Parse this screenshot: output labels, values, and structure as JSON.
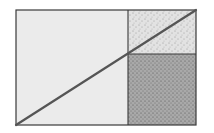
{
  "diagram": {
    "type": "geometric-dissection",
    "outer_rect": {
      "x": 16,
      "y": 10,
      "width": 180,
      "height": 115
    },
    "vertical_divider_x": 128,
    "horizontal_divider_y": 54,
    "diagonal": {
      "x1": 16,
      "y1": 125,
      "x2": 196,
      "y2": 10
    },
    "regions": [
      {
        "id": "left",
        "fill": "#ebebeb",
        "stippled": false
      },
      {
        "id": "top-right",
        "fill": "#e2e2e2",
        "stippled": true
      },
      {
        "id": "bottom-right",
        "fill": "#a9a9a9",
        "stippled": true
      }
    ],
    "colors": {
      "stroke": "#3a3a3a",
      "diagonal": "#555555",
      "stipple": "#4a4a4a",
      "background": "#ffffff"
    }
  }
}
